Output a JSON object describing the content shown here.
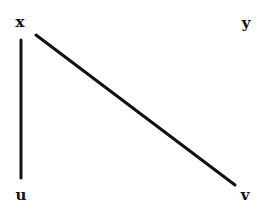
{
  "diagram": {
    "type": "graph",
    "background": "#ffffff",
    "edge_color": "#111111",
    "label_color": "#111111",
    "nodes": [
      {
        "id": "x",
        "label": "x",
        "x": 20,
        "y": 22
      },
      {
        "id": "y",
        "label": "y",
        "x": 246,
        "y": 23
      },
      {
        "id": "u",
        "label": "u",
        "x": 21,
        "y": 195
      },
      {
        "id": "v",
        "label": "v",
        "x": 245,
        "y": 195
      }
    ],
    "edges": [
      {
        "from": "x",
        "to": "u",
        "x1": 21,
        "y1": 40,
        "x2": 21,
        "y2": 178
      },
      {
        "from": "x",
        "to": "v",
        "x1": 36,
        "y1": 35,
        "x2": 235,
        "y2": 185
      }
    ]
  }
}
